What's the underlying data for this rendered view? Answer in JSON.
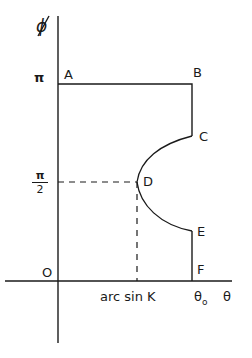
{
  "diagram": {
    "y_axis_label": "ϕ",
    "x_axis_label": "θ",
    "y_ticks": {
      "pi": "π",
      "half_pi_num": "π",
      "half_pi_den": "2",
      "origin": "O"
    },
    "x_ticks": {
      "arcsin": "arc sin K",
      "theta0": "θ",
      "theta0_sub": "o"
    },
    "points": {
      "A": "A",
      "B": "B",
      "C": "C",
      "D": "D",
      "E": "E",
      "F": "F"
    },
    "colors": {
      "line": "#1a1a1a",
      "background": "#ffffff"
    }
  }
}
